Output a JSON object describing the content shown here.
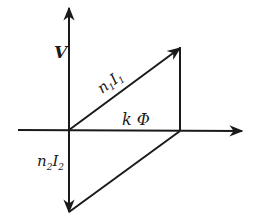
{
  "diagram": {
    "type": "phasor-diagram",
    "colors": {
      "ink": "#1a1a1a",
      "background": "#ffffff"
    },
    "origin": {
      "x": 69,
      "y": 130
    },
    "axes": {
      "vertical": {
        "label": "V",
        "top": {
          "x": 69,
          "y": 8
        },
        "bottom": {
          "x": 69,
          "y": 212
        }
      },
      "horizontal": {
        "left": {
          "x": 18,
          "y": 130
        },
        "right": {
          "x": 242,
          "y": 131
        }
      }
    },
    "vectors": [
      {
        "id": "n1I1",
        "label_main": "n",
        "label_sub1": "1",
        "label_main2": "I",
        "label_sub2": "1",
        "from": {
          "x": 69,
          "y": 130
        },
        "to": {
          "x": 180,
          "y": 48
        }
      },
      {
        "id": "n2I2",
        "label_main": "n",
        "label_sub1": "2",
        "label_main2": "I",
        "label_sub2": "2",
        "from": {
          "x": 69,
          "y": 130
        },
        "to": {
          "x": 69,
          "y": 212
        }
      }
    ],
    "segments": [
      {
        "id": "vertical-side",
        "from": {
          "x": 180,
          "y": 48
        },
        "to": {
          "x": 180,
          "y": 131
        }
      },
      {
        "id": "closing-side",
        "from": {
          "x": 180,
          "y": 131
        },
        "to": {
          "x": 69,
          "y": 212
        }
      }
    ],
    "labels": {
      "voltage": "V",
      "flux_k": "k",
      "flux_phi": "Φ"
    }
  }
}
